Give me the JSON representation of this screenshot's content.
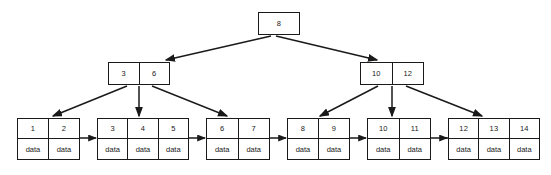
{
  "diagram": {
    "type": "b-plus-tree",
    "payload_label": "data",
    "colors": {
      "stroke": "#1a1a1a",
      "fill": "#ffffff",
      "background": "#ffffff",
      "text": "#1a1a1a"
    },
    "levels": [
      {
        "name": "root-level",
        "nodes": [
          {
            "id": "root",
            "role": "root",
            "keys": [
              "8"
            ],
            "x": 258,
            "y": 12,
            "width": 42,
            "height": 23
          }
        ]
      },
      {
        "name": "internal-level",
        "nodes": [
          {
            "id": "internal-left",
            "role": "internal",
            "keys": [
              "3",
              "6"
            ],
            "x": 108,
            "y": 62,
            "width": 62,
            "height": 23
          },
          {
            "id": "internal-right",
            "role": "internal",
            "keys": [
              "10",
              "12"
            ],
            "x": 360,
            "y": 62,
            "width": 64,
            "height": 23
          }
        ]
      },
      {
        "name": "leaf-level",
        "nodes": [
          {
            "id": "leaf-1",
            "role": "leaf",
            "keys": [
              "1",
              "2"
            ],
            "payloads": [
              "data",
              "data"
            ],
            "x": 17,
            "y": 118,
            "width": 63,
            "height": 42
          },
          {
            "id": "leaf-2",
            "role": "leaf",
            "keys": [
              "3",
              "4",
              "5"
            ],
            "payloads": [
              "data",
              "data",
              "data"
            ],
            "x": 97,
            "y": 118,
            "width": 92,
            "height": 42
          },
          {
            "id": "leaf-3",
            "role": "leaf",
            "keys": [
              "6",
              "7"
            ],
            "payloads": [
              "data",
              "data"
            ],
            "x": 206,
            "y": 118,
            "width": 64,
            "height": 42
          },
          {
            "id": "leaf-4",
            "role": "leaf",
            "keys": [
              "8",
              "9"
            ],
            "payloads": [
              "data",
              "data"
            ],
            "x": 287,
            "y": 118,
            "width": 63,
            "height": 42
          },
          {
            "id": "leaf-5",
            "role": "leaf",
            "keys": [
              "10",
              "11"
            ],
            "payloads": [
              "data",
              "data"
            ],
            "x": 367,
            "y": 118,
            "width": 64,
            "height": 42
          },
          {
            "id": "leaf-6",
            "role": "leaf",
            "keys": [
              "12",
              "13",
              "14"
            ],
            "payloads": [
              "data",
              "data",
              "data"
            ],
            "x": 448,
            "y": 118,
            "width": 92,
            "height": 42
          }
        ]
      }
    ],
    "child_pointers": [
      {
        "from": "root",
        "to": "internal-left"
      },
      {
        "from": "root",
        "to": "internal-right"
      },
      {
        "from": "internal-left",
        "to": "leaf-1"
      },
      {
        "from": "internal-left",
        "to": "leaf-2"
      },
      {
        "from": "internal-left",
        "to": "leaf-3"
      },
      {
        "from": "internal-right",
        "to": "leaf-4"
      },
      {
        "from": "internal-right",
        "to": "leaf-5"
      },
      {
        "from": "internal-right",
        "to": "leaf-6"
      }
    ],
    "sibling_pointers": [
      {
        "from": "leaf-1",
        "to": "leaf-2"
      },
      {
        "from": "leaf-2",
        "to": "leaf-3"
      },
      {
        "from": "leaf-3",
        "to": "leaf-4"
      },
      {
        "from": "leaf-4",
        "to": "leaf-5"
      },
      {
        "from": "leaf-5",
        "to": "leaf-6"
      }
    ]
  }
}
